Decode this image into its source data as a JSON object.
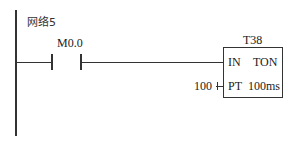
{
  "network": {
    "label": "网络5"
  },
  "contact": {
    "address": "M0.0",
    "type": "normally-open"
  },
  "timer": {
    "name": "T38",
    "type_label": "TON",
    "input_label": "IN",
    "preset_label": "PT",
    "resolution": "100ms",
    "preset_value": "100"
  },
  "colors": {
    "line": "#333333",
    "background": "#ffffff"
  }
}
